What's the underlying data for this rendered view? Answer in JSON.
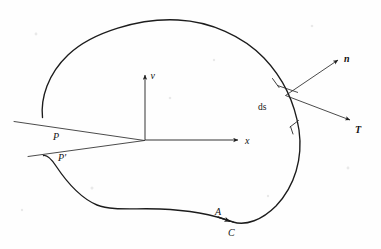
{
  "figure": {
    "type": "vector-calculus-diagram",
    "background_color": "#ffffff",
    "line_color": "#1c1c1c"
  },
  "labels": {
    "y_axis": "v",
    "x_axis": "x",
    "normal_vector": "n",
    "tangent_vector": "T",
    "arc_element": "ds",
    "area": "A",
    "contour": "C",
    "point_p": "P",
    "point_p_prime": "P'"
  },
  "elements": {
    "closed_curve_name": "boundary-curve-C",
    "region_name": "region-A",
    "slit_name": "slit-wedge-PP-prime",
    "origin_label": "coordinate-origin"
  },
  "geometry": {
    "origin": {
      "x": 145,
      "y": 140
    },
    "y_axis_tip": {
      "x": 145,
      "y": 72
    },
    "x_axis_tip": {
      "x": 241,
      "y": 140
    },
    "vector_base": {
      "x": 285,
      "y": 95
    },
    "normal_tip": {
      "x": 340,
      "y": 59
    },
    "tangent_tip": {
      "x": 352,
      "y": 121
    },
    "contour_arrow": {
      "x": 233,
      "y": 222
    }
  }
}
